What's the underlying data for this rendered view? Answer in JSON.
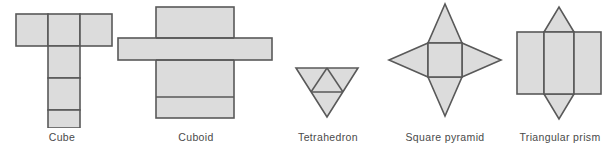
{
  "figure": {
    "background_color": "#ffffff",
    "fill_color": "#dcdcdc",
    "stroke_color": "#595959",
    "caption_color": "#4a4a4a",
    "stroke_width": 1.6
  },
  "nets": [
    {
      "id": "cube",
      "label": "Cube",
      "shape_type": "net",
      "solid": "cube",
      "faces": 6,
      "face_shape": "square",
      "arrangement": "T-shape: three squares in a top row, three squares descending from the middle square",
      "caption_x_center": 62,
      "geometry": {
        "unit": 32,
        "squares": [
          {
            "col": 0,
            "row": 0
          },
          {
            "col": 1,
            "row": 0
          },
          {
            "col": 2,
            "row": 0
          },
          {
            "col": 1,
            "row": 1
          },
          {
            "col": 1,
            "row": 2
          },
          {
            "col": 1,
            "row": 3
          }
        ]
      }
    },
    {
      "id": "cuboid",
      "label": "Cuboid",
      "shape_type": "net",
      "solid": "cuboid",
      "faces": 6,
      "face_shape": "rectangle",
      "arrangement": "Cross shape: a tall vertical strip of four rectangles crossed by a wide horizontal strip of side faces",
      "caption_x_center": 196,
      "geometry": {
        "vertical_strip": {
          "x": 40,
          "y": 8,
          "width": 78,
          "height": 108
        },
        "horizontal_strip": {
          "x": 3,
          "y": 39,
          "width": 154,
          "height": 22
        },
        "divider_lines_y": [
          98
        ]
      }
    },
    {
      "id": "tetrahedron",
      "label": "Tetrahedron",
      "shape_type": "net",
      "solid": "tetrahedron",
      "faces": 4,
      "face_shape": "triangle",
      "arrangement": "Large inverted triangle subdivided into four smaller triangles",
      "caption_x_center": 328,
      "geometry": {
        "outer_triangle": [
          [
            3,
            3
          ],
          [
            61,
            3
          ],
          [
            32,
            49
          ]
        ],
        "inner_triangle": [
          [
            17,
            26
          ],
          [
            47,
            26
          ],
          [
            32,
            3
          ]
        ]
      }
    },
    {
      "id": "square-pyramid",
      "label": "Square pyramid",
      "shape_type": "net",
      "solid": "square pyramid",
      "faces": 5,
      "face_shape": "square and four triangles",
      "arrangement": "Four-pointed star: a central square with an isosceles triangle folded out from each edge",
      "caption_x_center": 445,
      "geometry": {
        "square": {
          "x": 41,
          "y": 41,
          "width": 34,
          "height": 34
        },
        "points": {
          "top": [
            58,
            2
          ],
          "bottom": [
            58,
            114
          ],
          "left": [
            2,
            58
          ],
          "right": [
            114,
            58
          ]
        }
      }
    },
    {
      "id": "triangular-prism",
      "label": "Triangular prism",
      "shape_type": "net",
      "solid": "triangular prism",
      "faces": 5,
      "face_shape": "three rectangles and two triangles",
      "arrangement": "Three rectangles side by side with a triangle above and a triangle below the centre rectangle",
      "caption_x_center": 557,
      "geometry": {
        "rectangles": [
          {
            "x": 3,
            "y": 26,
            "width": 27,
            "height": 62
          },
          {
            "x": 30,
            "y": 26,
            "width": 27,
            "height": 62
          },
          {
            "x": 57,
            "y": 26,
            "width": 27,
            "height": 62
          }
        ],
        "top_triangle": [
          [
            30,
            26
          ],
          [
            57,
            26
          ],
          [
            43.5,
            3
          ]
        ],
        "bottom_triangle": [
          [
            30,
            88
          ],
          [
            57,
            88
          ],
          [
            43.5,
            111
          ]
        ]
      }
    }
  ]
}
